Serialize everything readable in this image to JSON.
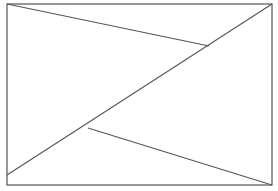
{
  "diagram": {
    "width": 278,
    "height": 191,
    "stroke_color": "#555555",
    "background": "#ffffff",
    "rectangle": {
      "x": 7,
      "y": 4,
      "width": 265,
      "height": 181
    },
    "lines": [
      {
        "name": "main-diagonal",
        "x1": 7,
        "y1": 175,
        "x2": 272,
        "y2": 4
      },
      {
        "name": "upper-segment",
        "x1": 7,
        "y1": 4,
        "x2": 209,
        "y2": 46
      },
      {
        "name": "lower-segment",
        "x1": 88,
        "y1": 128,
        "x2": 272,
        "y2": 185
      }
    ]
  }
}
